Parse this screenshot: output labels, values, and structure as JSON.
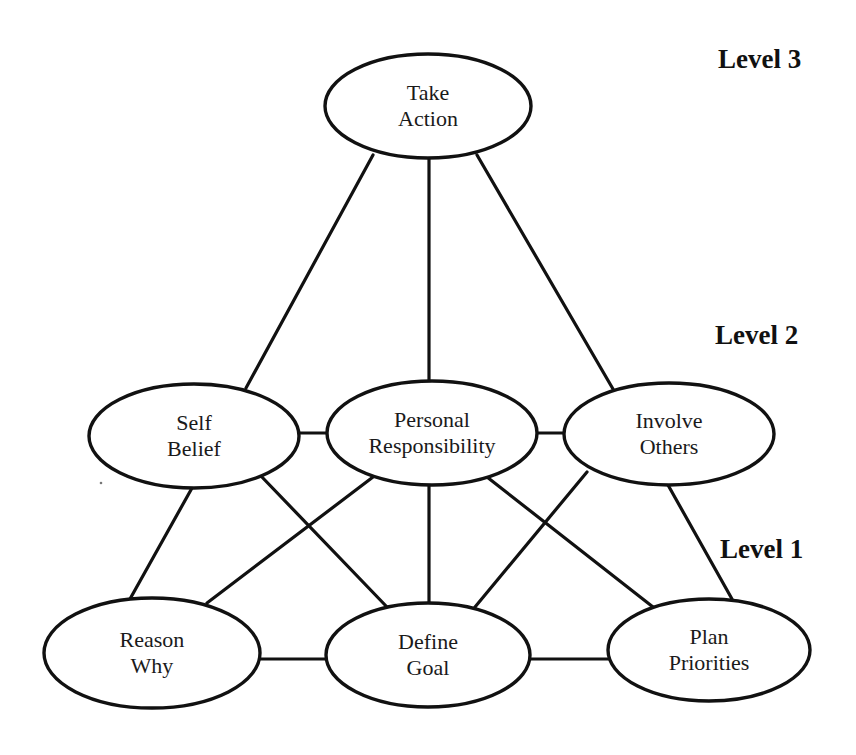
{
  "diagram": {
    "type": "hierarchy-network",
    "levels": [
      {
        "id": "level3",
        "label": "Level 3",
        "x": 718,
        "y": 68
      },
      {
        "id": "level2",
        "label": "Level 2",
        "x": 715,
        "y": 344
      },
      {
        "id": "level1",
        "label": "Level 1",
        "x": 720,
        "y": 558
      }
    ],
    "nodes": [
      {
        "id": "take_action",
        "level": 3,
        "line1": "Take",
        "line2": "Action",
        "cx": 428,
        "cy": 106,
        "rx": 103,
        "ry": 52
      },
      {
        "id": "self_belief",
        "level": 2,
        "line1": "Self",
        "line2": "Belief",
        "cx": 194,
        "cy": 436,
        "rx": 105,
        "ry": 52
      },
      {
        "id": "personal_responsibility",
        "level": 2,
        "line1": "Personal",
        "line2": "Responsibility",
        "cx": 432,
        "cy": 433,
        "rx": 105,
        "ry": 52
      },
      {
        "id": "involve_others",
        "level": 2,
        "line1": "Involve",
        "line2": "Others",
        "cx": 669,
        "cy": 434,
        "rx": 105,
        "ry": 51
      },
      {
        "id": "reason_why",
        "level": 1,
        "line1": "Reason",
        "line2": "Why",
        "cx": 152,
        "cy": 653,
        "rx": 108,
        "ry": 55
      },
      {
        "id": "define_goal",
        "level": 1,
        "line1": "Define",
        "line2": "Goal",
        "cx": 428,
        "cy": 655,
        "rx": 102,
        "ry": 52
      },
      {
        "id": "plan_priorities",
        "level": 1,
        "line1": "Plan",
        "line2": "Priorities",
        "cx": 709,
        "cy": 650,
        "rx": 101,
        "ry": 51
      }
    ],
    "edges": [
      {
        "from": "take_action",
        "to": "self_belief",
        "x1": 373,
        "y1": 155,
        "x2": 246,
        "y2": 388
      },
      {
        "from": "take_action",
        "to": "personal_responsibility",
        "x1": 429,
        "y1": 158,
        "x2": 429,
        "y2": 381
      },
      {
        "from": "take_action",
        "to": "involve_others",
        "x1": 477,
        "y1": 155,
        "x2": 613,
        "y2": 389
      },
      {
        "from": "self_belief",
        "to": "personal_responsibility",
        "x1": 298,
        "y1": 433,
        "x2": 327,
        "y2": 433
      },
      {
        "from": "personal_responsibility",
        "to": "involve_others",
        "x1": 537,
        "y1": 433,
        "x2": 565,
        "y2": 433
      },
      {
        "from": "self_belief",
        "to": "reason_why",
        "x1": 192,
        "y1": 488,
        "x2": 130,
        "y2": 599
      },
      {
        "from": "self_belief",
        "to": "define_goal",
        "x1": 260,
        "y1": 475,
        "x2": 387,
        "y2": 607
      },
      {
        "from": "personal_responsibility",
        "to": "reason_why",
        "x1": 373,
        "y1": 477,
        "x2": 207,
        "y2": 603
      },
      {
        "from": "personal_responsibility",
        "to": "define_goal",
        "x1": 429,
        "y1": 485,
        "x2": 429,
        "y2": 603
      },
      {
        "from": "personal_responsibility",
        "to": "plan_priorities",
        "x1": 487,
        "y1": 477,
        "x2": 653,
        "y2": 607
      },
      {
        "from": "involve_others",
        "to": "define_goal",
        "x1": 587,
        "y1": 472,
        "x2": 475,
        "y2": 607
      },
      {
        "from": "involve_others",
        "to": "plan_priorities",
        "x1": 668,
        "y1": 485,
        "x2": 732,
        "y2": 599
      },
      {
        "from": "reason_why",
        "to": "define_goal",
        "x1": 260,
        "y1": 659,
        "x2": 326,
        "y2": 659
      },
      {
        "from": "define_goal",
        "to": "plan_priorities",
        "x1": 530,
        "y1": 659,
        "x2": 608,
        "y2": 659
      }
    ],
    "colors": {
      "stroke": "#111111",
      "text": "#1a1a1a",
      "background": "#ffffff"
    }
  }
}
